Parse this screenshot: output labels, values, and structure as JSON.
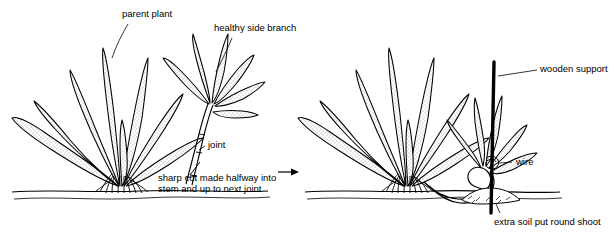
{
  "diagram": {
    "type": "botanical-propagation-diagram",
    "panels": [
      {
        "name": "before",
        "description": "Parent plant at left with a healthy side branch at right; a sharp cut is made halfway into the stem and up to the next joint."
      },
      {
        "name": "after",
        "description": "The cut side branch is pegged down into the soil, held by a wooden support and wire, with extra soil put round the shoot."
      }
    ],
    "labels": {
      "parent_plant": "parent plant",
      "healthy_side_branch": "healthy side branch",
      "joint": "joint",
      "cut_note_line1": "sharp cut made halfway into",
      "cut_note_line2": "stem and up to next joint",
      "wooden_support": "wooden support",
      "wire": "wire",
      "extra_soil_line1": "extra soil put round shoot"
    },
    "colors": {
      "ink": "#000000",
      "leaf_fill": "#e8e8e8",
      "paper": "#ffffff",
      "support": "#000000"
    }
  }
}
